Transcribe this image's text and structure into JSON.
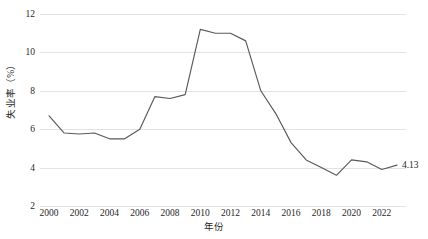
{
  "chart_data": {
    "type": "line",
    "title": "",
    "xlabel": "年份",
    "ylabel": "失业率（%）",
    "xlim": [
      1999.4,
      2023.6
    ],
    "ylim": [
      2,
      12
    ],
    "grid": true,
    "legend": "none",
    "series_name": "失业率",
    "line_color": "#595959",
    "x": [
      2000,
      2001,
      2002,
      2003,
      2004,
      2005,
      2006,
      2007,
      2008,
      2009,
      2010,
      2011,
      2012,
      2013,
      2014,
      2015,
      2016,
      2017,
      2018,
      2019,
      2020,
      2021,
      2022,
      2023
    ],
    "values": [
      6.7,
      5.8,
      5.75,
      5.8,
      5.5,
      5.5,
      6.0,
      7.7,
      7.6,
      7.8,
      11.2,
      11.0,
      11.0,
      10.6,
      8.0,
      6.8,
      5.3,
      4.4,
      4.0,
      3.6,
      4.4,
      4.3,
      3.9,
      4.13
    ],
    "xticks": [
      2000,
      2002,
      2004,
      2006,
      2008,
      2010,
      2012,
      2014,
      2016,
      2018,
      2020,
      2022
    ],
    "xticklabels": [
      "2000",
      "2002",
      "2004",
      "2006",
      "2008",
      "2010",
      "2012",
      "2014",
      "2016",
      "2018",
      "2020",
      "2022"
    ],
    "yticks": [
      2,
      4,
      6,
      8,
      10,
      12
    ],
    "yticklabels": [
      "2",
      "4",
      "6",
      "8",
      "10",
      "12"
    ],
    "annotations": [
      {
        "name": "last-value-label",
        "text": "4.13",
        "x": 2023,
        "y": 4.13
      }
    ]
  }
}
